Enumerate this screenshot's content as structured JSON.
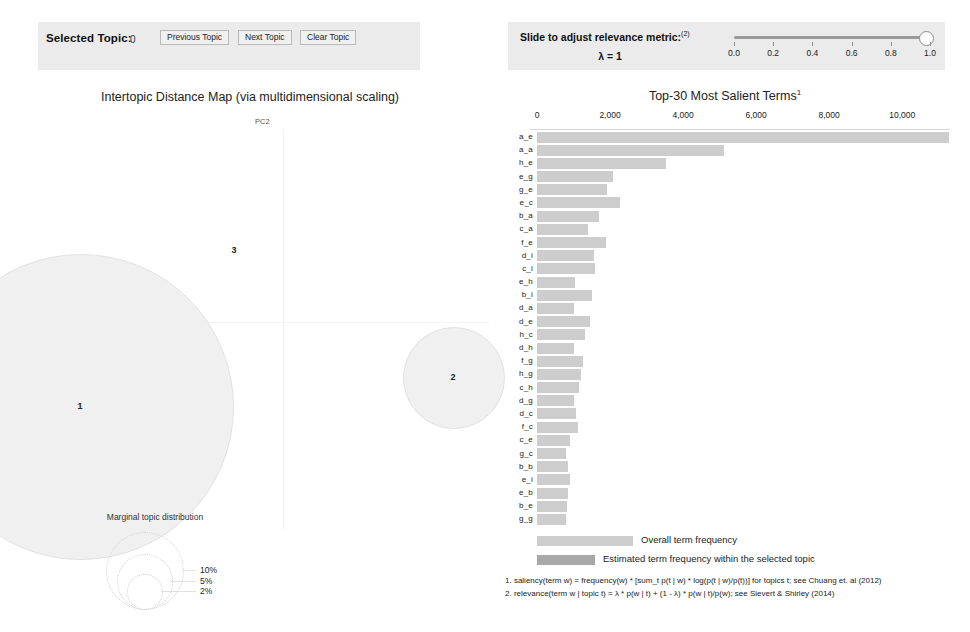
{
  "left_panel": {
    "selected_topic_label": "Selected Topic:",
    "selected_topic_value": "0",
    "previous_topic": "Previous Topic",
    "next_topic": "Next Topic",
    "clear_topic": "Clear Topic"
  },
  "right_panel": {
    "slider_label": "Slide to adjust relevance metric:",
    "slider_label_sup": "(2)",
    "lambda_text": "λ = 1",
    "lambda_value": 1.0,
    "slider_ticks": [
      "0.0",
      "0.2",
      "0.4",
      "0.6",
      "0.8",
      "1.0"
    ]
  },
  "intertopic_map": {
    "title": "Intertopic Distance Map (via multidimensional scaling)",
    "x_axis_label": "PC1",
    "y_axis_label": "PC2",
    "topics": [
      {
        "id": "1",
        "cx": 80,
        "cy": 406,
        "r": 152
      },
      {
        "id": "2",
        "cx": 453,
        "cy": 377,
        "r": 50
      },
      {
        "id": "3",
        "cx": 234,
        "cy": 250,
        "r": 4
      }
    ],
    "marginal_title": "Marginal topic distribution",
    "marginal_legend": [
      {
        "label": "2%",
        "r": 17
      },
      {
        "label": "5%",
        "r": 27
      },
      {
        "label": "10%",
        "r": 38
      }
    ]
  },
  "chart_data": {
    "type": "bar",
    "title": "Top-30 Most Salient Terms",
    "title_sup": "1",
    "xlabel": "",
    "ylabel": "",
    "xlim": [
      0,
      11500
    ],
    "xticks": [
      0,
      2000,
      4000,
      6000,
      8000,
      10000
    ],
    "xtick_labels": [
      "0",
      "2,000",
      "4,000",
      "6,000",
      "8,000",
      "10,000"
    ],
    "grid": false,
    "orientation": "horizontal",
    "legend_position": "bottom",
    "categories": [
      "a_e",
      "a_a",
      "h_e",
      "e_g",
      "g_e",
      "e_c",
      "b_a",
      "c_a",
      "f_e",
      "d_i",
      "c_i",
      "e_h",
      "b_i",
      "d_a",
      "d_e",
      "h_c",
      "d_h",
      "f_g",
      "h_g",
      "c_h",
      "d_g",
      "d_c",
      "f_c",
      "c_e",
      "g_c",
      "b_b",
      "e_i",
      "e_b",
      "b_e",
      "g_g"
    ],
    "series": [
      {
        "name": "Overall term frequency",
        "color": "#cdcdcd",
        "values": [
          11280,
          5120,
          3540,
          2080,
          1930,
          2260,
          1700,
          1390,
          1880,
          1560,
          1580,
          1030,
          1500,
          1010,
          1450,
          1310,
          1010,
          1260,
          1210,
          1160,
          1000,
          1080,
          1130,
          900,
          800,
          840,
          900,
          840,
          830,
          800
        ]
      },
      {
        "name": "Estimated term frequency within the selected topic",
        "color": "#a8a8a8",
        "values": [
          0,
          0,
          0,
          0,
          0,
          0,
          0,
          0,
          0,
          0,
          0,
          0,
          0,
          0,
          0,
          0,
          0,
          0,
          0,
          0,
          0,
          0,
          0,
          0,
          0,
          0,
          0,
          0,
          0,
          0
        ]
      }
    ],
    "legend": [
      "Overall term frequency",
      "Estimated term frequency within the selected topic"
    ]
  },
  "footnotes": {
    "note_1": "1. saliency(term w) = frequency(w) * [sum_t p(t | w) * log(p(t | w)/p(t))] for topics t; see Chuang et. al (2012)",
    "note_2": "2. relevance(term w | topic t) = λ * p(w | t) + (1 - λ) * p(w | t)/p(w); see Sievert & Shirley (2014)"
  }
}
